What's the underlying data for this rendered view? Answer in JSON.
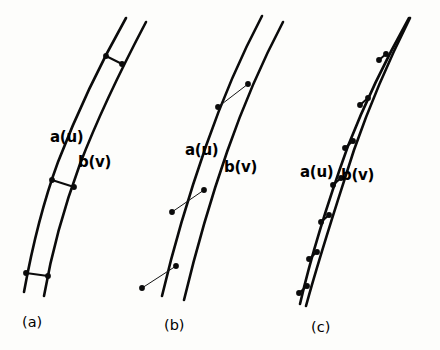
{
  "figure": {
    "background_color": "#fdfdfb",
    "ink_color": "#0b0b0b",
    "panels": [
      {
        "id": "a",
        "caption": "(a)",
        "caption_x": 22,
        "caption_y": 327,
        "labels": {
          "curve_a": "a(u)",
          "curve_a_x": 50,
          "curve_a_y": 142,
          "curve_b": "b(v)",
          "curve_b_x": 78,
          "curve_b_y": 167
        },
        "curve_a_path": "M 126 18 C 104 57, 78 110, 58 162 C 44 200, 32 248, 24 292",
        "curve_b_path": "M 146 22 C 126 60, 100 112, 80 164 C 66 202, 52 250, 44 296",
        "connectors": [
          {
            "x1": 106,
            "y1": 56,
            "x2": 122,
            "y2": 64
          },
          {
            "x1": 52,
            "y1": 180,
            "x2": 74,
            "y2": 187
          },
          {
            "x1": 26,
            "y1": 273,
            "x2": 48,
            "y2": 276
          }
        ],
        "nodes": [
          {
            "x": 106,
            "y": 56
          },
          {
            "x": 122,
            "y": 64
          },
          {
            "x": 52,
            "y": 180
          },
          {
            "x": 74,
            "y": 187
          },
          {
            "x": 26,
            "y": 273
          },
          {
            "x": 48,
            "y": 276
          }
        ]
      },
      {
        "id": "b",
        "caption": "(b)",
        "caption_x": 164,
        "caption_y": 330,
        "labels": {
          "curve_a": "a(u)",
          "curve_a_x": 185,
          "curve_a_y": 155,
          "curve_b": "b(v)",
          "curve_b_x": 224,
          "curve_b_y": 172
        },
        "curve_a_path": "M 262 16 C 243 52, 222 100, 206 146 C 190 192, 174 245, 162 296",
        "curve_b_path": "M 283 22 C 264 58, 243 106, 227 152 C 211 198, 196 250, 184 300",
        "connectors": [
          {
            "x1": 218,
            "y1": 107,
            "x2": 248,
            "y2": 84
          },
          {
            "x1": 172,
            "y1": 212,
            "x2": 204,
            "y2": 190
          },
          {
            "x1": 142,
            "y1": 288,
            "x2": 176,
            "y2": 266
          }
        ],
        "nodes": [
          {
            "x": 218,
            "y": 107
          },
          {
            "x": 248,
            "y": 84
          },
          {
            "x": 172,
            "y": 212
          },
          {
            "x": 204,
            "y": 190
          },
          {
            "x": 142,
            "y": 288
          },
          {
            "x": 176,
            "y": 266
          }
        ]
      },
      {
        "id": "c",
        "caption": "(c)",
        "caption_x": 311,
        "caption_y": 332,
        "labels": {
          "curve_a": "a(u)",
          "curve_a_x": 300,
          "curve_a_y": 177,
          "curve_b": "b(v)",
          "curve_b_x": 341,
          "curve_b_y": 180
        },
        "curve_a_path": "M 409 18 C 390 52, 366 100, 348 146 C 330 196, 312 252, 300 304",
        "curve_b_path": "M 410 18 C 392 54, 370 104, 354 150 C 338 200, 320 254, 306 306",
        "connectors": [
          {
            "x1": 379,
            "y1": 60,
            "x2": 386,
            "y2": 54
          },
          {
            "x1": 360,
            "y1": 105,
            "x2": 368,
            "y2": 98
          },
          {
            "x1": 345,
            "y1": 148,
            "x2": 353,
            "y2": 141
          },
          {
            "x1": 333,
            "y1": 185,
            "x2": 341,
            "y2": 178
          },
          {
            "x1": 321,
            "y1": 222,
            "x2": 329,
            "y2": 215
          },
          {
            "x1": 309,
            "y1": 259,
            "x2": 317,
            "y2": 252
          },
          {
            "x1": 299,
            "y1": 293,
            "x2": 307,
            "y2": 286
          }
        ],
        "nodes": [
          {
            "x": 379,
            "y": 60
          },
          {
            "x": 386,
            "y": 54
          },
          {
            "x": 360,
            "y": 105
          },
          {
            "x": 368,
            "y": 98
          },
          {
            "x": 345,
            "y": 148
          },
          {
            "x": 353,
            "y": 141
          },
          {
            "x": 333,
            "y": 185
          },
          {
            "x": 341,
            "y": 178
          },
          {
            "x": 321,
            "y": 222
          },
          {
            "x": 329,
            "y": 215
          },
          {
            "x": 309,
            "y": 259
          },
          {
            "x": 317,
            "y": 252
          },
          {
            "x": 299,
            "y": 293
          },
          {
            "x": 307,
            "y": 286
          }
        ]
      }
    ]
  }
}
